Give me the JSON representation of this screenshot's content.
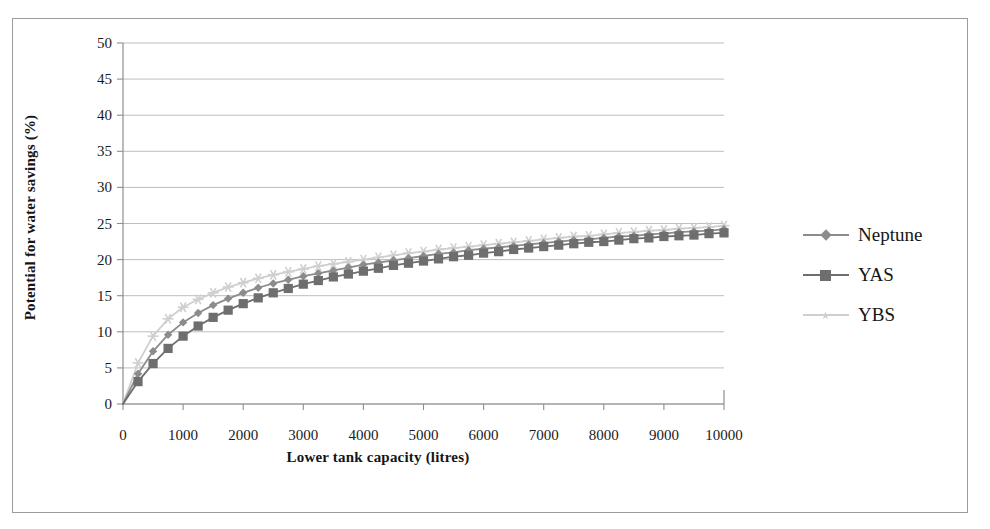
{
  "figure": {
    "border_color": "#9b9b9b",
    "background": "#ffffff"
  },
  "axes": {
    "y_title": "Potential for water savings (%)",
    "x_title": "Lower tank capacity (litres)",
    "y_ticks": [
      "0",
      "5",
      "10",
      "15",
      "20",
      "25",
      "30",
      "35",
      "40",
      "45",
      "50"
    ],
    "x_ticks": [
      "0",
      "1000",
      "2000",
      "3000",
      "4000",
      "5000",
      "6000",
      "7000",
      "8000",
      "9000",
      "10000"
    ],
    "gridline_color": "#b5b5b5",
    "axis_color": "#8e8e8e"
  },
  "legend": {
    "position": "right",
    "items": [
      {
        "label": "Neptune",
        "color": "#8c8c8c",
        "marker": "diamond"
      },
      {
        "label": "YAS",
        "color": "#6e6e6e",
        "marker": "square"
      },
      {
        "label": "YBS",
        "color": "#cfcfcf",
        "marker": "star"
      }
    ]
  },
  "chart_data": {
    "type": "line",
    "title": "",
    "subtitle": "",
    "xlabel": "Lower tank capacity (litres)",
    "ylabel": "Potential for water savings (%)",
    "xlim": [
      0,
      10000
    ],
    "ylim": [
      0,
      50
    ],
    "xtick_step": 1000,
    "ytick_step": 5,
    "grid": "horizontal",
    "legend_position": "right",
    "x": [
      0,
      250,
      500,
      750,
      1000,
      1250,
      1500,
      1750,
      2000,
      2250,
      2500,
      2750,
      3000,
      3250,
      3500,
      3750,
      4000,
      4250,
      4500,
      4750,
      5000,
      5250,
      5500,
      5750,
      6000,
      6250,
      6500,
      6750,
      7000,
      7250,
      7500,
      7750,
      8000,
      8250,
      8500,
      8750,
      9000,
      9250,
      9500,
      9750,
      10000
    ],
    "series": [
      {
        "name": "Neptune",
        "color": "#8c8c8c",
        "marker": "diamond",
        "values": [
          0.0,
          4.2,
          7.3,
          9.6,
          11.3,
          12.6,
          13.7,
          14.6,
          15.4,
          16.1,
          16.7,
          17.2,
          17.7,
          18.1,
          18.5,
          18.9,
          19.3,
          19.6,
          19.9,
          20.2,
          20.5,
          20.8,
          21.0,
          21.3,
          21.5,
          21.7,
          21.9,
          22.1,
          22.3,
          22.5,
          22.7,
          22.8,
          23.0,
          23.2,
          23.3,
          23.5,
          23.6,
          23.8,
          23.9,
          24.0,
          24.2
        ]
      },
      {
        "name": "YAS",
        "color": "#6e6e6e",
        "marker": "square",
        "values": [
          0.0,
          3.1,
          5.6,
          7.7,
          9.4,
          10.8,
          12.0,
          13.0,
          13.9,
          14.7,
          15.4,
          16.0,
          16.6,
          17.1,
          17.6,
          18.0,
          18.4,
          18.8,
          19.2,
          19.5,
          19.8,
          20.1,
          20.4,
          20.6,
          20.9,
          21.1,
          21.4,
          21.6,
          21.8,
          22.0,
          22.2,
          22.4,
          22.5,
          22.7,
          22.9,
          23.0,
          23.2,
          23.3,
          23.4,
          23.6,
          23.7
        ]
      },
      {
        "name": "YBS",
        "color": "#cfcfcf",
        "marker": "star",
        "values": [
          0.0,
          5.7,
          9.4,
          11.8,
          13.4,
          14.5,
          15.4,
          16.2,
          16.8,
          17.4,
          17.9,
          18.3,
          18.7,
          19.1,
          19.4,
          19.7,
          20.0,
          20.3,
          20.6,
          20.9,
          21.1,
          21.4,
          21.6,
          21.8,
          22.0,
          22.2,
          22.4,
          22.6,
          22.8,
          23.0,
          23.2,
          23.3,
          23.5,
          23.7,
          23.8,
          24.0,
          24.1,
          24.3,
          24.4,
          24.5,
          24.7
        ]
      }
    ]
  }
}
